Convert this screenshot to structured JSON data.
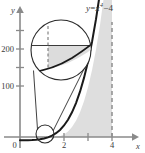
{
  "figure": {
    "title_label": "y = x⁴ − 4",
    "equation": {
      "lhs": "y",
      "equals": "=",
      "base": "x",
      "exponent": "4",
      "minus": "−",
      "constant": "4"
    },
    "axes": {
      "x_axis_name": "x",
      "y_axis_name": "y",
      "origin_label": "0",
      "x_ticks": [
        {
          "value": 2,
          "label": "2"
        },
        {
          "value": 3,
          "label": ""
        },
        {
          "value": 4,
          "label": "4"
        }
      ],
      "y_ticks": [
        {
          "value": 100,
          "label": "100"
        },
        {
          "value": 150,
          "label": ""
        },
        {
          "value": 200,
          "label": "200"
        },
        {
          "value": 250,
          "label": ""
        }
      ],
      "x_range": [
        -0.55,
        4.9
      ],
      "y_range": [
        -40,
        290
      ]
    },
    "curve": {
      "function": "x^4 - 4",
      "color": "#1a1a1a",
      "x_start": 0,
      "x_end": 4.15
    },
    "shaded_region": {
      "description": "area between curve and x-axis up to x = 4",
      "color": "#d8d8d8",
      "x_from": 1.4142,
      "x_to": 4
    },
    "dashed_line": {
      "at_x": 4,
      "color": "#8e8e8e"
    },
    "magnifier": {
      "small_circle": {
        "cx": 45,
        "cy": 134,
        "r": 9
      },
      "lens_circle": {
        "cx": 61,
        "cy": 50,
        "r": 30
      },
      "lens_contents": {
        "has_horizontal_line": true,
        "has_dashed_vertical_line": true,
        "has_shaded_region": true,
        "has_curve": true
      }
    },
    "colors": {
      "axis": "#8a8a8a",
      "curve": "#1a1a1a",
      "shade": "#d8d8d8",
      "text": "#3b3b3b",
      "lens_stroke": "#2b2b2b"
    }
  }
}
